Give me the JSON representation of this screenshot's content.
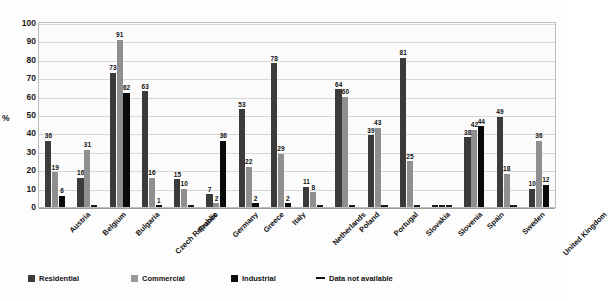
{
  "chart_data": {
    "type": "bar",
    "title": "",
    "xlabel": "",
    "ylabel": "%",
    "ylim": [
      0,
      100
    ],
    "ytick_labels": [
      "100",
      "90",
      "80",
      "70",
      "60",
      "50",
      "40",
      "30",
      "20",
      "10",
      "0"
    ],
    "ytick_values": [
      100,
      90,
      80,
      70,
      60,
      50,
      40,
      30,
      20,
      10,
      0
    ],
    "grid": true,
    "legend_position": "bottom",
    "categories": [
      "Austria",
      "Belgium",
      "Bulgaria",
      "Czech Republic",
      "France",
      "Germany",
      "Greece",
      "Italy",
      "Netherlands",
      "Poland",
      "Portugal",
      "Slovakia",
      "Slovenia",
      "Spain",
      "Sweden",
      "United Kingdom"
    ],
    "series": [
      {
        "name": "Residential",
        "color": "#3b3b3b",
        "values": [
          36,
          16,
          73,
          63,
          15,
          7,
          53,
          78,
          11,
          64,
          39,
          81,
          null,
          38,
          49,
          10
        ]
      },
      {
        "name": "Commercial",
        "color": "#9a9a9a",
        "values": [
          19,
          31,
          91,
          16,
          10,
          2,
          22,
          29,
          8,
          60,
          43,
          25,
          null,
          42,
          18,
          36
        ]
      },
      {
        "name": "Industrial",
        "color": "#0a0a0a",
        "values": [
          6,
          null,
          62,
          1,
          null,
          36,
          2,
          2,
          null,
          null,
          null,
          null,
          null,
          44,
          null,
          12
        ]
      }
    ],
    "na_marker_label": "Data not available",
    "legend": [
      {
        "label": "Residential",
        "marker": "swatch",
        "color": "#3b3b3b"
      },
      {
        "label": "Commercial",
        "marker": "swatch",
        "color": "#9a9a9a"
      },
      {
        "label": "Industrial",
        "marker": "swatch",
        "color": "#0a0a0a"
      },
      {
        "label": "Data not available",
        "marker": "dash",
        "color": "#111111"
      }
    ]
  }
}
